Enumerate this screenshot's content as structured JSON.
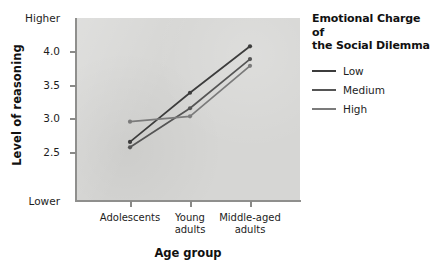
{
  "chart_data": {
    "type": "line",
    "title": "",
    "xlabel": "Age group",
    "ylabel": "Level of reasoning",
    "categories": [
      "Adolescents",
      "Young adults",
      "Middle-aged adults"
    ],
    "category_lines": [
      [
        "Adolescents"
      ],
      [
        "Young",
        "adults"
      ],
      [
        "Middle-aged",
        "adults"
      ]
    ],
    "x": [
      130,
      190,
      250
    ],
    "ylim": [
      2.25,
      4.25
    ],
    "yticks": [
      2.5,
      3.0,
      3.5,
      4.0
    ],
    "ytick_labels": [
      "2.5",
      "3.0",
      "3.5",
      "4.0"
    ],
    "y_top_label": "Higher",
    "y_bottom_label": "Lower",
    "grid": false,
    "legend_position": "right",
    "legend_title_lines": [
      "Emotional Charge of",
      "the Social Dilemma"
    ],
    "series": [
      {
        "name": "Low",
        "values": [
          2.65,
          3.38,
          4.07
        ],
        "color": "#3c3c3c"
      },
      {
        "name": "Medium",
        "values": [
          2.57,
          3.15,
          3.88
        ],
        "color": "#555555"
      },
      {
        "name": "High",
        "values": [
          2.95,
          3.03,
          3.78
        ],
        "color": "#7b7b7b"
      }
    ]
  },
  "legend": {
    "title_line1": "Emotional Charge of",
    "title_line2": "the Social Dilemma",
    "items": [
      {
        "label": "Low"
      },
      {
        "label": "Medium"
      },
      {
        "label": "High"
      }
    ]
  },
  "axes": {
    "y_title": "Level of reasoning",
    "x_title": "Age group",
    "y_high": "Higher",
    "y_low": "Lower",
    "ytick_0": "2.5",
    "ytick_1": "3.0",
    "ytick_2": "3.5",
    "ytick_3": "4.0",
    "xtick_0_line1": "Adolescents",
    "xtick_0_line2": "",
    "xtick_1_line1": "Young",
    "xtick_1_line2": "adults",
    "xtick_2_line1": "Middle-aged",
    "xtick_2_line2": "adults"
  }
}
